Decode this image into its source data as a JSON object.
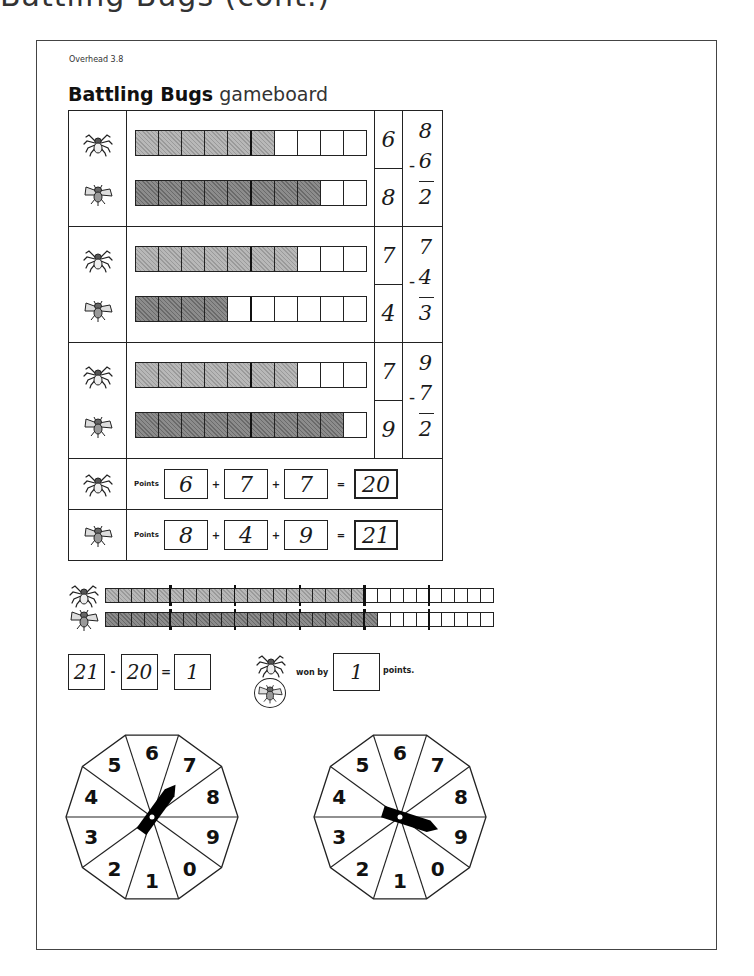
{
  "page": {
    "cutoff_heading": "Battling Bugs (cont.)",
    "overhead_label": "Overhead 3.8",
    "title_bold": "Battling Bugs",
    "title_light": "gameboard"
  },
  "players": {
    "spider": {
      "icon": "spider-icon",
      "fill_color": "#a8a8a8"
    },
    "fly": {
      "icon": "fly-icon",
      "fill_color": "#7a7a7a"
    }
  },
  "rounds": [
    {
      "spider_score": "6",
      "fly_score": "8",
      "spider_filled": 6,
      "fly_filled": 8,
      "sub_top": "8",
      "sub_minus": "-",
      "sub_bottom": "6",
      "sub_result": "2"
    },
    {
      "spider_score": "7",
      "fly_score": "4",
      "spider_filled": 7,
      "fly_filled": 4,
      "sub_top": "7",
      "sub_minus": "-",
      "sub_bottom": "4",
      "sub_result": "3"
    },
    {
      "spider_score": "7",
      "fly_score": "9",
      "spider_filled": 7,
      "fly_filled": 9,
      "sub_top": "9",
      "sub_minus": "-",
      "sub_bottom": "7",
      "sub_result": "2"
    }
  ],
  "bar_cells": 10,
  "points": {
    "label": "Points",
    "plus": "+",
    "equals": "=",
    "spider": {
      "values": [
        "6",
        "7",
        "7"
      ],
      "total": "20"
    },
    "fly": {
      "values": [
        "8",
        "4",
        "9"
      ],
      "total": "21"
    }
  },
  "cumulative": {
    "cells": 30,
    "tick_every": 5,
    "spider_filled": 20,
    "fly_filled": 21
  },
  "result": {
    "larger": "21",
    "minus": "-",
    "smaller": "20",
    "equals": "=",
    "difference": "1",
    "winner": "fly",
    "won_by_label": "won by",
    "won_by_value": "1",
    "points_label": "points."
  },
  "spinners": [
    {
      "name": "spinner-left",
      "numbers": [
        "6",
        "7",
        "8",
        "9",
        "0",
        "1",
        "2",
        "3",
        "4",
        "5"
      ],
      "pointer_angle_deg": 36,
      "pointing_to": "7"
    },
    {
      "name": "spinner-right",
      "numbers": [
        "6",
        "7",
        "8",
        "9",
        "0",
        "1",
        "2",
        "3",
        "4",
        "5"
      ],
      "pointer_angle_deg": 108,
      "pointing_to": "9"
    }
  ]
}
